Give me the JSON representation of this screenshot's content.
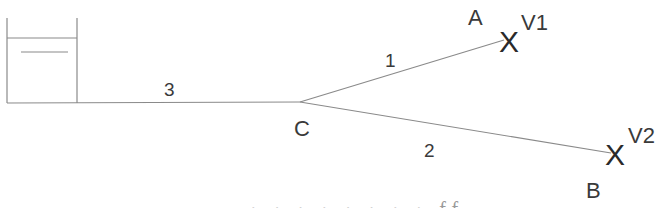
{
  "diagram": {
    "tank": {
      "label": ""
    },
    "junction": {
      "label": "C"
    },
    "pipes": [
      {
        "id": "pipe-1",
        "label": "1"
      },
      {
        "id": "pipe-2",
        "label": "2"
      },
      {
        "id": "pipe-3",
        "label": "3"
      }
    ],
    "nodes": [
      {
        "id": "A",
        "label": "A"
      },
      {
        "id": "B",
        "label": "B"
      }
    ],
    "valves": [
      {
        "id": "V1",
        "symbol": "X",
        "label": "V1"
      },
      {
        "id": "V2",
        "symbol": "X",
        "label": "V2"
      }
    ],
    "cutoff_text": "· · ·  ·  ·    ·     ·  · ff"
  }
}
